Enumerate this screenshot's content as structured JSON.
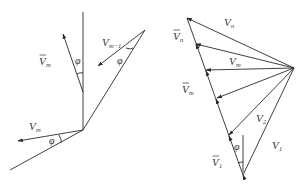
{
  "figure": {
    "left_diagram": {
      "labels": {
        "vbar_m": {
          "base": "V",
          "bar": true,
          "sub": "m"
        },
        "v_m_minus_1": {
          "base": "V",
          "bar": false,
          "sub": "m−1"
        },
        "v_m": {
          "base": "V",
          "bar": false,
          "sub": "m"
        },
        "phi_top": "φ",
        "phi_right": "φ",
        "phi_bottom": "φ"
      }
    },
    "right_diagram": {
      "labels": {
        "v_n": {
          "base": "V",
          "bar": false,
          "sub": "n"
        },
        "vbar_n": {
          "base": "V",
          "bar": true,
          "sub": "n"
        },
        "v_m": {
          "base": "V",
          "bar": false,
          "sub": "m"
        },
        "vbar_m": {
          "base": "V",
          "bar": true,
          "sub": "m"
        },
        "v_2": {
          "base": "V",
          "bar": false,
          "sub": "2"
        },
        "v_1": {
          "base": "V",
          "bar": false,
          "sub": "1"
        },
        "vbar_1": {
          "base": "V",
          "bar": true,
          "sub": "1"
        },
        "phi": "φ"
      }
    }
  }
}
